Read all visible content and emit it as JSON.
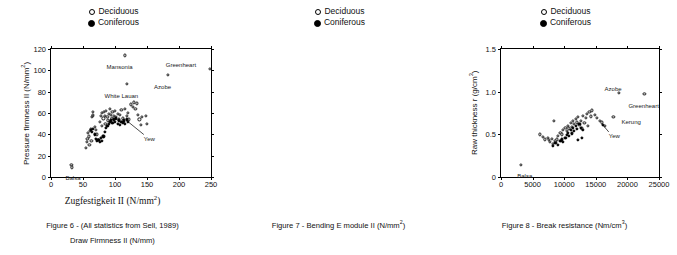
{
  "legend": {
    "deciduous_label": "Deciduous",
    "coniferous_label": "Coniferous",
    "deciduous_marker": "open-circle-icon",
    "coniferous_marker": "filled-circle-icon"
  },
  "panels": [
    {
      "id": "figure-6",
      "caption_line1": "Figure 6 - (All statistics from Sell, 1989)",
      "caption_line2": "Draw Firmness II (N/mm)",
      "axis_title_x": "Zugfestigkeit II (N/mm²)",
      "axis_title_y": "Pressure firmness II (N/mm²)"
    },
    {
      "id": "figure-7",
      "caption_line1": "Figure 7 - Bending E module II (N/mm²)",
      "caption_line2": "",
      "axis_title_x": "",
      "axis_title_y": "Raw thickness r (g/cm³)"
    },
    {
      "id": "figure-8",
      "caption_line1": "Figure 8 - Break resistance (Nm/cm³)",
      "caption_line2": "",
      "axis_title_x": "",
      "axis_title_y": "Brinell hardness  (N/mm²)"
    }
  ],
  "chart_data": [
    {
      "type": "scatter",
      "title": "Figure 6 - (All statistics from Sell, 1989)",
      "xlabel": "Zugfestigkeit II (N/mm²)",
      "ylabel": "Pressure firmness II (N/mm²)",
      "xlim": [
        0,
        250
      ],
      "ylim": [
        0,
        120
      ],
      "xticks": [
        0,
        50,
        100,
        150,
        200,
        250
      ],
      "yticks": [
        0,
        20,
        40,
        60,
        80,
        100,
        120
      ],
      "grid": false,
      "legend_position": "above-plot-center",
      "series": [
        {
          "name": "Deciduous",
          "marker": "open-circle",
          "points": [
            [
              32,
              11
            ],
            [
              33,
              9
            ],
            [
              55,
              27
            ],
            [
              56,
              33
            ],
            [
              57,
              36
            ],
            [
              58,
              41
            ],
            [
              59,
              38
            ],
            [
              60,
              30
            ],
            [
              61,
              43
            ],
            [
              62,
              45
            ],
            [
              63,
              34
            ],
            [
              64,
              56
            ],
            [
              65,
              57
            ],
            [
              65,
              61
            ],
            [
              66,
              58
            ],
            [
              68,
              47
            ],
            [
              70,
              44
            ],
            [
              72,
              40
            ],
            [
              74,
              35
            ],
            [
              76,
              52
            ],
            [
              78,
              57
            ],
            [
              79,
              60
            ],
            [
              80,
              48
            ],
            [
              82,
              55
            ],
            [
              83,
              61
            ],
            [
              84,
              57
            ],
            [
              85,
              50
            ],
            [
              86,
              62
            ],
            [
              88,
              56
            ],
            [
              89,
              53
            ],
            [
              90,
              59
            ],
            [
              92,
              64
            ],
            [
              94,
              58
            ],
            [
              95,
              55
            ],
            [
              96,
              61
            ],
            [
              98,
              57
            ],
            [
              100,
              62
            ],
            [
              102,
              56
            ],
            [
              104,
              59
            ],
            [
              106,
              54
            ],
            [
              108,
              58
            ],
            [
              110,
              63
            ],
            [
              112,
              55
            ],
            [
              114,
              52
            ],
            [
              116,
              64
            ],
            [
              118,
              57
            ],
            [
              120,
              60
            ],
            [
              122,
              54
            ],
            [
              125,
              68
            ],
            [
              128,
              66
            ],
            [
              130,
              70
            ],
            [
              132,
              64
            ],
            [
              134,
              69
            ],
            [
              136,
              58
            ],
            [
              138,
              54
            ],
            [
              140,
              49
            ],
            [
              142,
              56
            ],
            [
              148,
              57
            ],
            [
              150,
              50
            ],
            [
              115,
              114
            ],
            [
              118,
              87
            ],
            [
              183,
              96
            ],
            [
              248,
              101
            ]
          ]
        },
        {
          "name": "Coniferous",
          "marker": "filled-circle",
          "points": [
            [
              62,
              44
            ],
            [
              64,
              42
            ],
            [
              66,
              45
            ],
            [
              68,
              40
            ],
            [
              70,
              36
            ],
            [
              72,
              34
            ],
            [
              74,
              35
            ],
            [
              76,
              33
            ],
            [
              78,
              37
            ],
            [
              80,
              34
            ],
            [
              82,
              38
            ],
            [
              84,
              42
            ],
            [
              86,
              46
            ],
            [
              88,
              48
            ],
            [
              90,
              50
            ],
            [
              92,
              52
            ],
            [
              94,
              53
            ],
            [
              96,
              51
            ],
            [
              98,
              54
            ],
            [
              100,
              52
            ],
            [
              102,
              55
            ],
            [
              104,
              50
            ],
            [
              106,
              53
            ],
            [
              108,
              49
            ],
            [
              110,
              52
            ],
            [
              112,
              51
            ],
            [
              114,
              53
            ],
            [
              116,
              50
            ],
            [
              118,
              54
            ],
            [
              120,
              52
            ]
          ]
        }
      ],
      "annotations": [
        {
          "text": "Mansonia",
          "x": 115,
          "y": 114
        },
        {
          "text": "Greenheart",
          "x": 248,
          "y": 101
        },
        {
          "text": "Azobe",
          "x": 183,
          "y": 96
        },
        {
          "text": "White Lauan",
          "x": 118,
          "y": 87
        },
        {
          "text": "Yew",
          "x": 120,
          "y": 52
        },
        {
          "text": "Balsa",
          "x": 32,
          "y": 10
        }
      ]
    },
    {
      "type": "scatter",
      "title": "Figure 7 - Bending E module II (N/mm²)",
      "xlabel": "Bending E module II (N/mm²)",
      "ylabel": "Raw thickness r (g/cm³)",
      "xlim": [
        0,
        25000
      ],
      "ylim": [
        0,
        1.5
      ],
      "xticks": [
        0,
        5000,
        10000,
        15000,
        20000,
        25000
      ],
      "yticks": [
        0,
        0.5,
        1.0,
        1.5
      ],
      "grid": false,
      "legend_position": "above-plot-center",
      "series": [
        {
          "name": "Deciduous",
          "marker": "open-circle",
          "points": [
            [
              3200,
              0.14
            ],
            [
              6200,
              0.5
            ],
            [
              6600,
              0.47
            ],
            [
              7000,
              0.44
            ],
            [
              7400,
              0.46
            ],
            [
              7600,
              0.43
            ],
            [
              7800,
              0.41
            ],
            [
              8000,
              0.45
            ],
            [
              8200,
              0.39
            ],
            [
              8400,
              0.66
            ],
            [
              8600,
              0.42
            ],
            [
              8800,
              0.44
            ],
            [
              9000,
              0.48
            ],
            [
              9400,
              0.52
            ],
            [
              9600,
              0.5
            ],
            [
              9800,
              0.55
            ],
            [
              10200,
              0.58
            ],
            [
              10400,
              0.54
            ],
            [
              10600,
              0.6
            ],
            [
              10800,
              0.57
            ],
            [
              11000,
              0.63
            ],
            [
              11200,
              0.59
            ],
            [
              11400,
              0.66
            ],
            [
              11600,
              0.62
            ],
            [
              11800,
              0.68
            ],
            [
              12000,
              0.64
            ],
            [
              12200,
              0.7
            ],
            [
              12400,
              0.61
            ],
            [
              12600,
              0.66
            ],
            [
              12800,
              0.57
            ],
            [
              13000,
              0.72
            ],
            [
              13200,
              0.63
            ],
            [
              13400,
              0.69
            ],
            [
              13600,
              0.74
            ],
            [
              13800,
              0.6
            ],
            [
              14000,
              0.76
            ],
            [
              14200,
              0.71
            ],
            [
              14400,
              0.78
            ],
            [
              14800,
              0.73
            ],
            [
              15200,
              0.69
            ],
            [
              15600,
              0.66
            ],
            [
              16000,
              0.64
            ],
            [
              16400,
              0.6
            ],
            [
              17800,
              0.7
            ],
            [
              18600,
              0.99
            ],
            [
              22700,
              0.97
            ]
          ]
        },
        {
          "name": "Coniferous",
          "marker": "filled-circle",
          "points": [
            [
              8200,
              0.36
            ],
            [
              8600,
              0.4
            ],
            [
              9000,
              0.38
            ],
            [
              9400,
              0.42
            ],
            [
              9600,
              0.44
            ],
            [
              9800,
              0.41
            ],
            [
              10200,
              0.46
            ],
            [
              10400,
              0.49
            ],
            [
              10600,
              0.52
            ],
            [
              10800,
              0.48
            ],
            [
              11000,
              0.55
            ],
            [
              11200,
              0.51
            ],
            [
              11400,
              0.58
            ],
            [
              11600,
              0.54
            ],
            [
              11800,
              0.6
            ],
            [
              12000,
              0.56
            ],
            [
              12200,
              0.43
            ],
            [
              12400,
              0.62
            ],
            [
              12600,
              0.58
            ],
            [
              12800,
              0.46
            ],
            [
              13000,
              0.55
            ],
            [
              16100,
              0.61
            ]
          ]
        }
      ],
      "annotations": [
        {
          "text": "Azobe",
          "x": 18600,
          "y": 0.99
        },
        {
          "text": "Greenheart",
          "x": 22700,
          "y": 0.97
        },
        {
          "text": "Kerung",
          "x": 17800,
          "y": 0.7
        },
        {
          "text": "Yew",
          "x": 16100,
          "y": 0.61
        },
        {
          "text": "Balsa",
          "x": 3200,
          "y": 0.14
        }
      ]
    },
    {
      "type": "scatter",
      "title": "Figure 8 - Break resistance (Nm/cm³)",
      "xlabel": "Break resistance (Nm/cm³)",
      "ylabel": "Brinell hardness  (N/mm²)",
      "xlim": [
        0,
        16
      ],
      "ylim": [
        0,
        50
      ],
      "xticks": [
        0,
        4,
        8,
        12,
        16
      ],
      "yticks": [
        0,
        10,
        20,
        30,
        40,
        50
      ],
      "grid": false,
      "legend_position": "above-plot-center",
      "series": [
        {
          "name": "Deciduous",
          "marker": "open-circle",
          "points": [
            [
              0.4,
              2
            ],
            [
              2.2,
              15
            ],
            [
              2.4,
              16
            ],
            [
              2.6,
              13
            ],
            [
              2.8,
              17
            ],
            [
              3.0,
              32
            ],
            [
              3.1,
              26
            ],
            [
              3.2,
              25
            ],
            [
              3.3,
              30
            ],
            [
              3.4,
              30
            ],
            [
              3.5,
              18
            ],
            [
              3.6,
              14
            ],
            [
              3.7,
              12
            ],
            [
              3.8,
              11
            ],
            [
              3.9,
              13
            ],
            [
              4.0,
              19
            ],
            [
              4.1,
              21
            ],
            [
              4.2,
              22
            ],
            [
              4.3,
              23
            ],
            [
              4.4,
              24
            ],
            [
              4.5,
              16
            ],
            [
              4.6,
              13
            ],
            [
              4.7,
              12
            ],
            [
              4.8,
              15
            ],
            [
              4.9,
              18
            ],
            [
              5.0,
              26
            ],
            [
              5.1,
              33
            ],
            [
              5.2,
              29
            ],
            [
              5.3,
              12
            ],
            [
              5.4,
              13
            ],
            [
              5.5,
              23
            ],
            [
              5.6,
              31
            ],
            [
              5.8,
              33
            ],
            [
              5.9,
              26
            ],
            [
              6.0,
              22
            ],
            [
              6.2,
              32
            ],
            [
              6.3,
              36
            ],
            [
              6.4,
              30
            ],
            [
              6.5,
              23
            ],
            [
              6.6,
              21
            ],
            [
              6.8,
              48
            ],
            [
              7.0,
              26
            ],
            [
              7.4,
              38
            ],
            [
              7.6,
              28
            ],
            [
              8.0,
              26
            ],
            [
              8.4,
              34
            ],
            [
              9.0,
              32
            ],
            [
              10.2,
              33
            ],
            [
              12.2,
              48
            ],
            [
              13.4,
              40
            ]
          ]
        },
        {
          "name": "Coniferous",
          "marker": "filled-circle",
          "points": [
            [
              2.2,
              15
            ],
            [
              2.9,
              9
            ],
            [
              3.0,
              12
            ],
            [
              3.1,
              12
            ],
            [
              3.6,
              9
            ],
            [
              3.8,
              13
            ],
            [
              4.0,
              14
            ],
            [
              4.1,
              13
            ],
            [
              4.2,
              14
            ],
            [
              4.4,
              13
            ],
            [
              4.6,
              12
            ],
            [
              4.9,
              18
            ],
            [
              5.0,
              19
            ],
            [
              5.2,
              18
            ],
            [
              5.5,
              19
            ],
            [
              5.7,
              22
            ],
            [
              6.2,
              27
            ],
            [
              14.8,
              30
            ]
          ]
        }
      ],
      "annotations": [
        {
          "text": "Greenheart",
          "x": 6.8,
          "y": 48
        },
        {
          "text": "Locust",
          "x": 12.2,
          "y": 48
        },
        {
          "text": "Hickory",
          "x": 13.4,
          "y": 40
        },
        {
          "text": "Beech",
          "x": 10.2,
          "y": 33
        },
        {
          "text": "Yew",
          "x": 14.8,
          "y": 30
        },
        {
          "text": "Balsa",
          "x": 0.4,
          "y": 2
        }
      ]
    }
  ]
}
